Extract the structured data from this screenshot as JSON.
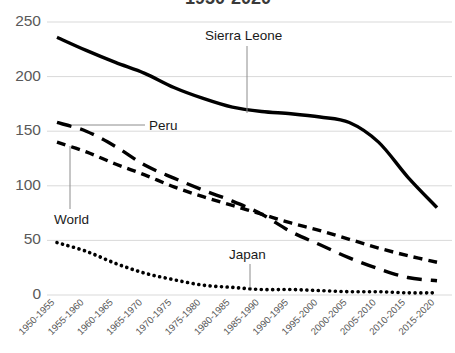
{
  "chart_data": {
    "type": "line",
    "title": "1950-2020",
    "xlabel": "",
    "ylabel": "",
    "ylim": [
      0,
      250
    ],
    "yticks": [
      0,
      50,
      100,
      150,
      200,
      250
    ],
    "grid": true,
    "legend_position": "inline-annotations",
    "categories": [
      "1950-1955",
      "1955-1960",
      "1960-1965",
      "1965-1970",
      "1970-1975",
      "1975-1980",
      "1980-1985",
      "1985-1990",
      "1990-1995",
      "1995-2000",
      "2000-2005",
      "2005-2010",
      "2010-2015",
      "2015-2020"
    ],
    "series": [
      {
        "name": "Sierra Leone",
        "style": "solid",
        "values": [
          236,
          224,
          213,
          203,
          190,
          180,
          172,
          168,
          166,
          163,
          158,
          140,
          108,
          80
        ]
      },
      {
        "name": "Peru",
        "style": "long-dash",
        "values": [
          158,
          150,
          136,
          119,
          107,
          96,
          86,
          74,
          58,
          46,
          34,
          24,
          16,
          13
        ]
      },
      {
        "name": "World",
        "style": "dash",
        "values": [
          140,
          131,
          120,
          110,
          99,
          90,
          82,
          74,
          66,
          59,
          51,
          43,
          36,
          30
        ]
      },
      {
        "name": "Japan",
        "style": "dot",
        "values": [
          48,
          40,
          29,
          20,
          14,
          9,
          7,
          5,
          5,
          4,
          3,
          3,
          2,
          2
        ]
      }
    ],
    "annotations": [
      {
        "label": "Sierra Leone",
        "series": "Sierra Leone"
      },
      {
        "label": "Peru",
        "series": "Peru"
      },
      {
        "label": "World",
        "series": "World"
      },
      {
        "label": "Japan",
        "series": "Japan"
      }
    ]
  },
  "axis": {
    "y_labels": [
      "250",
      "200",
      "150",
      "100",
      "50",
      "0"
    ]
  },
  "colors": {
    "line": "#000000",
    "gridline": "#d9d9d9",
    "tick_text": "#595959",
    "label_text": "#1a1a1a",
    "background": "#ffffff"
  }
}
